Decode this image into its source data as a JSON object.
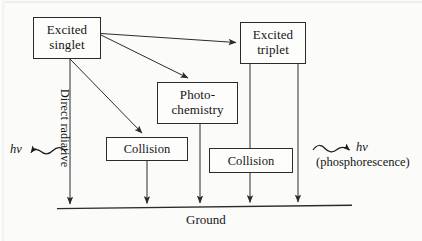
{
  "diagram": {
    "nodes": {
      "excited_singlet": "Excited\nsinglet",
      "excited_triplet": "Excited\ntriplet",
      "photochemistry": "Photo-\nchemistry",
      "collision_left": "Collision",
      "collision_right": "Collision"
    },
    "labels": {
      "ground": "Ground",
      "direct_radiative": "Direct radiative",
      "hv_left": "hν",
      "hv_right": "hν",
      "phosphorescence": "(phosphorescence)"
    },
    "colors": {
      "stroke": "#2b2b2b",
      "text": "#151515",
      "background": "#fbfbfa",
      "box_fill": "#fdfdfc"
    },
    "edges": [
      {
        "from": "excited_singlet",
        "to": "excited_triplet",
        "kind": "arrow-straight"
      },
      {
        "from": "excited_singlet",
        "to": "photochemistry",
        "kind": "arrow-diagonal"
      },
      {
        "from": "excited_singlet",
        "to": "collision_left",
        "kind": "arrow-diagonal"
      },
      {
        "from": "excited_singlet",
        "to": "ground",
        "kind": "arrow-vertical",
        "note": "Direct radiative"
      },
      {
        "from": "photochemistry",
        "to": "ground",
        "kind": "arrow-vertical"
      },
      {
        "from": "collision_left",
        "to": "ground",
        "kind": "arrow-vertical"
      },
      {
        "from": "excited_triplet",
        "to": "collision_right",
        "kind": "line-vertical"
      },
      {
        "from": "collision_right",
        "to": "ground",
        "kind": "arrow-vertical"
      },
      {
        "from": "excited_triplet",
        "to": "ground",
        "kind": "arrow-vertical",
        "note": "phosphorescence"
      }
    ],
    "photon_emissions": [
      {
        "id": "hv_left",
        "direction": "left",
        "label": "hν"
      },
      {
        "id": "hv_right",
        "direction": "right",
        "label": "hν"
      }
    ]
  }
}
